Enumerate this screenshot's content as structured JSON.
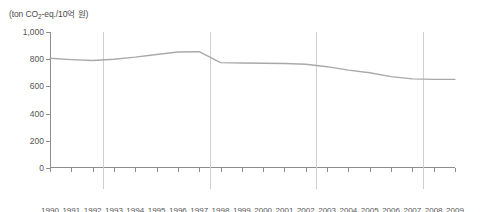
{
  "chart_data": {
    "type": "line",
    "title": "",
    "subtitle": "",
    "unit_label": "(ton CO2-eq./10억 원)",
    "unit_label_parts": {
      "prefix": "(ton CO",
      "sub": "2",
      "suffix": "-eq./10억 원)"
    },
    "xlabel": "",
    "ylabel": "",
    "x": [
      1990,
      1991,
      1992,
      1993,
      1994,
      1995,
      1996,
      1997,
      1998,
      1999,
      2000,
      2001,
      2002,
      2003,
      2004,
      2005,
      2006,
      2007,
      2008,
      2009
    ],
    "categories": [
      "1990",
      "1991",
      "1992",
      "1993",
      "1994",
      "1995",
      "1996",
      "1997",
      "1998",
      "1999",
      "2000",
      "2001",
      "2002",
      "2003",
      "2004",
      "2005",
      "2006",
      "2007",
      "2008",
      "2009"
    ],
    "values": [
      807,
      797,
      790,
      800,
      815,
      835,
      853,
      855,
      775,
      772,
      770,
      768,
      763,
      745,
      720,
      700,
      672,
      655,
      652,
      652
    ],
    "series": [
      {
        "name": "온실가스 배출원단위",
        "values": [
          807,
          797,
          790,
          800,
          815,
          835,
          853,
          855,
          775,
          772,
          770,
          768,
          763,
          745,
          720,
          700,
          672,
          655,
          652,
          652
        ],
        "color": "#a9a9a9"
      }
    ],
    "ylim": [
      0,
      1000
    ],
    "xlim": [
      1990,
      2009
    ],
    "yticks": [
      0,
      200,
      400,
      600,
      800,
      1000
    ],
    "ytick_labels": [
      "0",
      "200",
      "400",
      "600",
      "800",
      "1,000"
    ],
    "grid": false,
    "legend": false,
    "legend_position": "none",
    "annotations": []
  },
  "periods": [
    {
      "label": "노태우 정부",
      "start": 1990,
      "end": 1992
    },
    {
      "label": "김영삼 정부",
      "start": 1993,
      "end": 1997
    },
    {
      "label": "김대중 정부",
      "start": 1998,
      "end": 2002
    },
    {
      "label": "노무현 정부",
      "start": 2003,
      "end": 2007
    },
    {
      "label": "이명박 정부",
      "start": 2008,
      "end": 2009
    }
  ],
  "period_dividers": [
    1992.5,
    1997.5,
    2002.5,
    2007.5
  ],
  "colors": {
    "line": "#a9a9a9",
    "axis": "#8d8d8d",
    "divider": "#cfcfcf",
    "tick_text": "#555555",
    "period_text": "#3d3d3d",
    "background": "#ffffff"
  }
}
